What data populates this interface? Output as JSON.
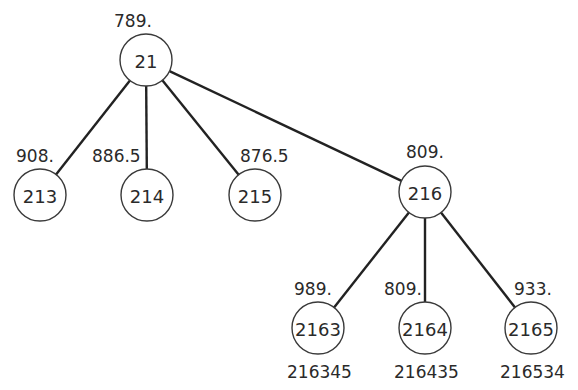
{
  "diagram": {
    "type": "tree",
    "nodes": [
      {
        "id": "21",
        "label": "21",
        "value": "789.",
        "cx": 146,
        "cy": 60,
        "vx": 114,
        "vy": 27,
        "anchor": "start"
      },
      {
        "id": "213",
        "label": "213",
        "value": "908.",
        "cx": 40,
        "cy": 195,
        "vx": 16,
        "vy": 162,
        "anchor": "start"
      },
      {
        "id": "214",
        "label": "214",
        "value": "886.5",
        "cx": 147,
        "cy": 195,
        "vx": 92,
        "vy": 162,
        "anchor": "start"
      },
      {
        "id": "215",
        "label": "215",
        "value": "876.5",
        "cx": 255,
        "cy": 195,
        "vx": 240,
        "vy": 162,
        "anchor": "start"
      },
      {
        "id": "216",
        "label": "216",
        "value": "809.",
        "cx": 425,
        "cy": 192,
        "vx": 406,
        "vy": 158,
        "anchor": "start"
      },
      {
        "id": "2163",
        "label": "2163",
        "value": "989.",
        "cx": 318,
        "cy": 328,
        "vx": 294,
        "vy": 295,
        "anchor": "start"
      },
      {
        "id": "2164",
        "label": "2164",
        "value": "809.",
        "cx": 425,
        "cy": 328,
        "vx": 384,
        "vy": 295,
        "anchor": "start"
      },
      {
        "id": "2165",
        "label": "2165",
        "value": "933.",
        "cx": 531,
        "cy": 328,
        "vx": 514,
        "vy": 295,
        "anchor": "start"
      }
    ],
    "edges": [
      {
        "from": "21",
        "to": "213"
      },
      {
        "from": "21",
        "to": "214"
      },
      {
        "from": "21",
        "to": "215"
      },
      {
        "from": "21",
        "to": "216"
      },
      {
        "from": "216",
        "to": "2163"
      },
      {
        "from": "216",
        "to": "2164"
      },
      {
        "from": "216",
        "to": "2165"
      }
    ],
    "leaf_sequences": [
      {
        "under": "2163",
        "text": "216345",
        "x": 287,
        "y": 378
      },
      {
        "under": "2164",
        "text": "216435",
        "x": 394,
        "y": 378
      },
      {
        "under": "2165",
        "text": "216534",
        "x": 500,
        "y": 378
      }
    ],
    "node_radius": 26
  }
}
